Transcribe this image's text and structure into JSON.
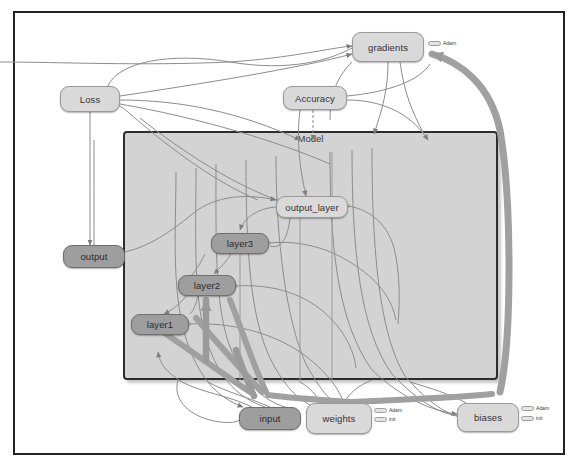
{
  "window": {
    "type": "graph-visualization",
    "background": "#ffffff",
    "frame_color": "#23231f"
  },
  "graph": {
    "title_node": "Model",
    "container": {
      "label": "Model",
      "fill": "#d3d3d3",
      "border": "#2d2d2d"
    },
    "nodes": [
      {
        "id": "gradients",
        "label": "gradients",
        "style": "light",
        "x": 352,
        "y": 32,
        "w": 72,
        "h": 30
      },
      {
        "id": "loss",
        "label": "Loss",
        "style": "light",
        "x": 60,
        "y": 86,
        "w": 60,
        "h": 26
      },
      {
        "id": "accuracy",
        "label": "Accuracy",
        "style": "light",
        "x": 283,
        "y": 86,
        "w": 64,
        "h": 24
      },
      {
        "id": "output_layer",
        "label": "output_layer",
        "style": "light",
        "x": 276,
        "y": 196,
        "w": 72,
        "h": 22
      },
      {
        "id": "layer3",
        "label": "layer3",
        "style": "dark",
        "x": 211,
        "y": 233,
        "w": 58,
        "h": 21
      },
      {
        "id": "layer2",
        "label": "layer2",
        "style": "dark",
        "x": 178,
        "y": 275,
        "w": 58,
        "h": 21
      },
      {
        "id": "layer1",
        "label": "layer1",
        "style": "dark",
        "x": 131,
        "y": 314,
        "w": 58,
        "h": 21
      },
      {
        "id": "output",
        "label": "output",
        "style": "dark",
        "x": 63,
        "y": 245,
        "w": 62,
        "h": 23
      },
      {
        "id": "input",
        "label": "input",
        "style": "dark",
        "x": 239,
        "y": 407,
        "w": 62,
        "h": 23
      },
      {
        "id": "weights",
        "label": "weights",
        "style": "light",
        "x": 306,
        "y": 403,
        "w": 66,
        "h": 31
      },
      {
        "id": "biases",
        "label": "biases",
        "style": "light",
        "x": 457,
        "y": 403,
        "w": 62,
        "h": 29
      }
    ],
    "annotations": [
      {
        "id": "gradients-adam",
        "labels": [
          "Adam"
        ],
        "x": 428,
        "y": 41
      },
      {
        "id": "weights-adam",
        "labels": [
          "Adam",
          "init"
        ],
        "x": 374,
        "y": 408
      },
      {
        "id": "biases-adam",
        "labels": [
          "Adam",
          "init"
        ],
        "x": 521,
        "y": 406
      }
    ],
    "edge_colors": {
      "thin": "#8c8c8c",
      "thick": "#9a9a9a",
      "reference": "#b0b0b0"
    }
  }
}
